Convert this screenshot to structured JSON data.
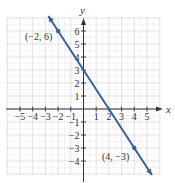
{
  "chart_data": {
    "type": "line",
    "title": "",
    "xlabel": "x",
    "ylabel": "y",
    "xlim": [
      -6,
      6
    ],
    "ylim": [
      -5,
      7
    ],
    "grid": true,
    "x_ticks": [
      -5,
      -4,
      -3,
      -2,
      -1,
      1,
      2,
      3,
      4,
      5
    ],
    "y_ticks": [
      -4,
      -3,
      -2,
      -1,
      1,
      2,
      3,
      4,
      5,
      6
    ],
    "x_tick_labels": [
      "−5",
      "−4",
      "−3",
      "−2",
      "−1",
      "1",
      "2",
      "3",
      "4",
      "5"
    ],
    "y_tick_labels": [
      "−4",
      "−3",
      "−2",
      "−1",
      "1",
      "2",
      "3",
      "4",
      "5",
      "6"
    ],
    "series": [
      {
        "name": "line",
        "equation": "y = -1.5x + 3",
        "color": "#3a5f9a",
        "points": [
          {
            "x": -2,
            "y": 6,
            "label": "(−2, 6)"
          },
          {
            "x": 4,
            "y": -3,
            "label": "(4, −3)"
          }
        ]
      }
    ],
    "annotations": [
      "(−2, 6)",
      "(4, −3)"
    ]
  },
  "colors": {
    "line": "#3a5f9a",
    "grid": "#d9d9d9",
    "axis": "#333333"
  }
}
